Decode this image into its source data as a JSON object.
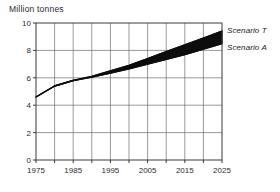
{
  "chart": {
    "axis_title": "Million tonnes",
    "frame": {
      "left": 36,
      "right": 222,
      "top": 23,
      "bottom": 160
    },
    "colors": {
      "band": "#0d0d0d",
      "line": "#0d0d0d",
      "grid": "#6e6e6e",
      "frame": "#3a3a3a",
      "text": "#2b2b2b",
      "background": "#ffffff"
    }
  },
  "chart_data": {
    "type": "area",
    "title": "Million tonnes",
    "xlabel": "",
    "ylabel": "Million tonnes",
    "xlim": [
      1975,
      2025
    ],
    "ylim": [
      0,
      10
    ],
    "xticks": [
      1975,
      1980,
      1985,
      1990,
      1995,
      2000,
      2005,
      2010,
      2015,
      2020,
      2025
    ],
    "xtick_labels": [
      "1975",
      "",
      "1985",
      "",
      "1995",
      "",
      "2005",
      "",
      "2015",
      "",
      "2025"
    ],
    "xtick_labels_shown": [
      "1975",
      "1985",
      "1995",
      "2005",
      "2015",
      "2025"
    ],
    "yticks": [
      0,
      2,
      4,
      6,
      8,
      10
    ],
    "ytick_labels": [
      "0",
      "2",
      "4",
      "6",
      "8",
      "10"
    ],
    "grid": true,
    "legend": "inline-right",
    "x": [
      1975,
      1980,
      1985,
      1990,
      1995,
      2000,
      2005,
      2010,
      2015,
      2020,
      2025
    ],
    "series": [
      {
        "name": "Scenario T",
        "label": "Scenario T",
        "role": "band-upper",
        "values": [
          4.6,
          5.4,
          5.8,
          6.1,
          6.5,
          6.9,
          7.4,
          7.9,
          8.4,
          8.9,
          9.4
        ]
      },
      {
        "name": "Scenario A",
        "label": "Scenario A",
        "role": "band-lower",
        "values": [
          4.6,
          5.4,
          5.8,
          6.05,
          6.35,
          6.65,
          7.0,
          7.35,
          7.7,
          8.1,
          8.5
        ]
      }
    ],
    "annotations": [
      {
        "text": "Scenario T",
        "attach": "upper-edge-end",
        "style": "italic"
      },
      {
        "text": "Scenario A",
        "attach": "lower-edge-end",
        "style": "italic"
      }
    ]
  }
}
